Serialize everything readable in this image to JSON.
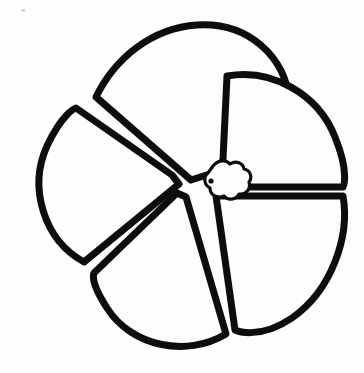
{
  "document": {
    "title": "Hand-drawn flower line art",
    "background_color": "#fdfdfb",
    "ink_color": "#0d0d0d",
    "width": 364,
    "height": 373,
    "alt_text": "Black ink outline drawing of a five-petal flower with rounded wedge petals radiating from a small scalloped center"
  },
  "artwork": {
    "kind": "line-drawing",
    "subject": "five-petal-flower",
    "stroke_color": "#0d0d0d",
    "fill_color": "#fdfdfb",
    "stroke_width": 7,
    "center": {
      "x": 190,
      "y": 185
    },
    "petal_count": 5,
    "petals": [
      {
        "name": "petal-top-left",
        "label": "Top left petal",
        "path": "M 191 180 L 96 97 C 115 58 152 28 197 25 C 248 22 286 56 290 104 L 216 172 Z"
      },
      {
        "name": "petal-top-right",
        "label": "Top right petal",
        "path": "M 222 180 L 227 76 C 272 68 318 94 335 137 C 350 174 343 187 343 187 L 228 187 Z"
      },
      {
        "name": "petal-bottom-right",
        "label": "Bottom right petal",
        "path": "M 228 196 L 343 196 C 350 236 332 290 292 318 C 258 341 235 330 235 330 L 216 196 Z"
      },
      {
        "name": "petal-bottom-left",
        "label": "Bottom left petal",
        "path": "M 186 197 L 226 334 C 186 358 131 346 107 308 C 87 277 95 272 95 272 L 177 193 Z"
      },
      {
        "name": "petal-left",
        "label": "Left petal",
        "path": "M 179 184 L 84 262 C 44 240 28 188 47 146 C 63 112 76 108 76 108 L 172 175 Z"
      }
    ],
    "center_hub": {
      "name": "flower-center-hub",
      "label": "Scalloped flower center",
      "path": "M 213 166 C 218 160 226 159 230 164 C 236 160 243 163 244 169 C 250 170 253 177 249 182 C 251 189 246 195 239 194 C 236 200 228 201 224 196 C 217 199 210 195 210 188 C 204 185 203 177 208 173 Z",
      "dot": {
        "x": 211,
        "y": 181,
        "r": 2.6
      }
    },
    "specks": [
      {
        "x": 21,
        "y": 9,
        "w": 4,
        "h": 3
      }
    ]
  }
}
